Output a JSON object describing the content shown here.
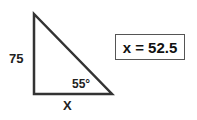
{
  "diagram": {
    "triangle": {
      "vertical_side_label": "75",
      "base_label": "X",
      "angle_label": "55°"
    },
    "answer_box": {
      "text": "x = 52.5"
    }
  }
}
